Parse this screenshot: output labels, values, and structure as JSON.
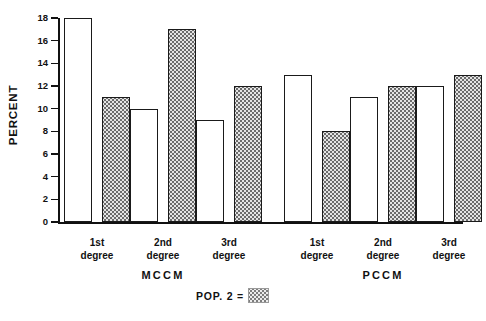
{
  "chart_data": {
    "type": "bar",
    "title": "",
    "xlabel": "",
    "ylabel": "PERCENT",
    "ylim": [
      0,
      18
    ],
    "ytick_step": 2,
    "yticks": [
      "18",
      "16",
      "14",
      "12",
      "10",
      "8",
      "6",
      "4",
      "2",
      "0"
    ],
    "grid": false,
    "legend_position": "bottom-center",
    "categories": [
      "1st degree",
      "2nd degree",
      "3rd degree",
      "1st degree",
      "2nd degree",
      "3rd degree"
    ],
    "category_lines": [
      [
        "1st",
        "degree"
      ],
      [
        "2nd",
        "degree"
      ],
      [
        "3rd",
        "degree"
      ],
      [
        "1st",
        "degree"
      ],
      [
        "2nd",
        "degree"
      ],
      [
        "3rd",
        "degree"
      ]
    ],
    "groups": [
      {
        "name": "MCCM",
        "category_indices": [
          0,
          1,
          2
        ]
      },
      {
        "name": "PCCM",
        "category_indices": [
          3,
          4,
          5
        ]
      }
    ],
    "series": [
      {
        "name": "POP. 1",
        "style": "open",
        "values": [
          18,
          10,
          9,
          13,
          11,
          12
        ]
      },
      {
        "name": "POP. 2",
        "style": "dotted",
        "values": [
          11,
          17,
          12,
          8,
          12,
          13
        ]
      }
    ],
    "legend": [
      {
        "label": "POP. 2 =",
        "style": "dotted"
      }
    ],
    "colors": {
      "axis": "#111111",
      "bar_outline": "#1a1a1a",
      "bar_open_fill": "#ffffff",
      "bar_dotted_fill": "#e4e4e4",
      "bar_dot": "#6b6b6b",
      "background": "#ffffff"
    }
  },
  "axis": {
    "y_label": "PERCENT",
    "y_ticks": [
      "18",
      "16",
      "14",
      "12",
      "10",
      "8",
      "6",
      "4",
      "2",
      "0"
    ]
  },
  "legend": {
    "pop2_label": "POP. 2 ="
  },
  "group_labels": {
    "left": "MCCM",
    "right": "PCCM"
  }
}
